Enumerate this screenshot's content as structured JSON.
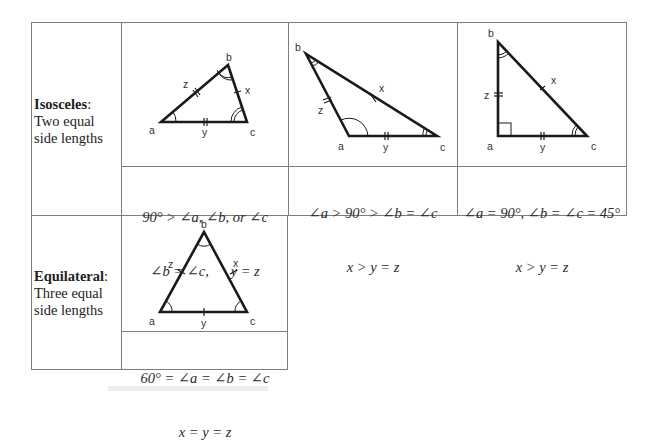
{
  "table": {
    "rows": [
      {
        "type": "Isosceles",
        "type_suffix": ":",
        "description_line1": "Two equal",
        "description_line2": "side lengths",
        "cases": [
          {
            "name": "acute-isosceles",
            "formula_line1": "90° > ∠a, ∠b, or ∠c",
            "formula_line2": "∠b = ∠c,      y = z",
            "labels": {
              "a": "a",
              "b": "b",
              "c": "c",
              "x": "x",
              "y": "y",
              "z": "z"
            }
          },
          {
            "name": "obtuse-isosceles",
            "formula_line1": "∠a > 90° > ∠b = ∠c",
            "formula_line2": "x > y = z",
            "labels": {
              "a": "a",
              "b": "b",
              "c": "c",
              "x": "x",
              "y": "y",
              "z": "z"
            }
          },
          {
            "name": "right-isosceles",
            "formula_line1": "∠a = 90°, ∠b = ∠c = 45°",
            "formula_line2": "x > y = z",
            "labels": {
              "a": "a",
              "b": "b",
              "c": "c",
              "x": "x",
              "y": "y",
              "z": "z"
            }
          }
        ]
      },
      {
        "type": "Equilateral",
        "type_suffix": ":",
        "description_line1": "Three equal",
        "description_line2": "side lengths",
        "cases": [
          {
            "name": "equilateral",
            "formula_line1": "60° = ∠a = ∠b = ∠c",
            "formula_line2": "x = y = z",
            "labels": {
              "a": "a",
              "b": "b",
              "c": "c",
              "x": "x",
              "y": "y",
              "z": "z"
            }
          }
        ]
      }
    ]
  },
  "colors": {
    "border": "#7d7d7d",
    "stroke": "#1a1a1a",
    "text": "#222222"
  }
}
